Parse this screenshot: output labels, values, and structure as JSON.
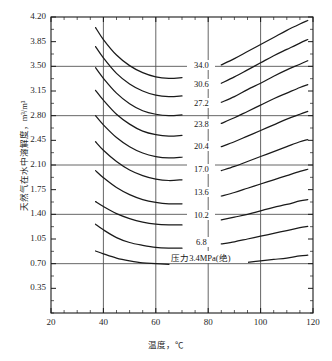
{
  "chart_data": {
    "type": "line",
    "title": "",
    "xlabel": "温度，℃",
    "ylabel": "天然气在水中溶解度，m³/m³",
    "xlim": [
      20,
      120
    ],
    "ylim": [
      0,
      4.2
    ],
    "xticks": [
      20,
      40,
      60,
      80,
      100,
      120
    ],
    "yticks": [
      0.35,
      0.7,
      1.05,
      1.4,
      1.75,
      2.1,
      2.45,
      2.8,
      3.15,
      3.5,
      3.85,
      4.2
    ],
    "xminor_step": 5,
    "grid": {
      "x": [
        40,
        60,
        80,
        100
      ],
      "y": [
        0.7,
        1.4,
        2.1,
        2.8,
        3.5
      ]
    },
    "legend_position": "inline-curve-labels",
    "annotation": "压力3.4MPa(绝)",
    "series_unit": "MPa",
    "series": [
      {
        "name": "34.0",
        "label": "34.0",
        "x": [
          37,
          40,
          45,
          50,
          55,
          60,
          65,
          70,
          75,
          80,
          85,
          90,
          95,
          100,
          105,
          110,
          115,
          118
        ],
        "values": [
          4.05,
          3.88,
          3.66,
          3.51,
          3.41,
          3.35,
          3.33,
          3.34,
          3.38,
          3.44,
          3.52,
          3.61,
          3.71,
          3.81,
          3.91,
          4.01,
          4.1,
          4.15
        ]
      },
      {
        "name": "30.6",
        "label": "30.6",
        "x": [
          37,
          40,
          45,
          50,
          55,
          60,
          65,
          70,
          75,
          80,
          85,
          90,
          95,
          100,
          105,
          110,
          115,
          118
        ],
        "values": [
          3.78,
          3.62,
          3.4,
          3.25,
          3.15,
          3.09,
          3.07,
          3.08,
          3.12,
          3.18,
          3.26,
          3.35,
          3.45,
          3.55,
          3.65,
          3.74,
          3.83,
          3.88
        ]
      },
      {
        "name": "27.2",
        "label": "27.2",
        "x": [
          37,
          40,
          45,
          50,
          55,
          60,
          65,
          70,
          75,
          80,
          85,
          90,
          95,
          100,
          105,
          110,
          115,
          118
        ],
        "values": [
          3.48,
          3.33,
          3.12,
          2.97,
          2.87,
          2.82,
          2.8,
          2.81,
          2.85,
          2.91,
          2.99,
          3.07,
          3.17,
          3.26,
          3.36,
          3.45,
          3.53,
          3.58
        ]
      },
      {
        "name": "23.8",
        "label": "23.8",
        "x": [
          37,
          40,
          45,
          50,
          55,
          60,
          65,
          70,
          75,
          80,
          85,
          90,
          95,
          100,
          105,
          110,
          115,
          118
        ],
        "values": [
          3.16,
          3.02,
          2.82,
          2.68,
          2.58,
          2.53,
          2.51,
          2.52,
          2.56,
          2.62,
          2.69,
          2.77,
          2.86,
          2.95,
          3.04,
          3.12,
          3.2,
          3.24
        ]
      },
      {
        "name": "20.4",
        "label": "20.4",
        "x": [
          37,
          40,
          45,
          50,
          55,
          60,
          65,
          70,
          75,
          80,
          85,
          90,
          95,
          100,
          105,
          110,
          115,
          118
        ],
        "values": [
          2.8,
          2.67,
          2.49,
          2.36,
          2.27,
          2.22,
          2.2,
          2.21,
          2.24,
          2.29,
          2.36,
          2.43,
          2.51,
          2.59,
          2.67,
          2.75,
          2.82,
          2.86
        ]
      },
      {
        "name": "17.0",
        "label": "17.0",
        "x": [
          37,
          40,
          45,
          50,
          55,
          60,
          65,
          70,
          75,
          80,
          85,
          90,
          95,
          100,
          105,
          110,
          115,
          118
        ],
        "values": [
          2.43,
          2.31,
          2.15,
          2.03,
          1.95,
          1.9,
          1.88,
          1.89,
          1.92,
          1.96,
          2.02,
          2.08,
          2.15,
          2.22,
          2.29,
          2.36,
          2.43,
          2.46
        ]
      },
      {
        "name": "13.6",
        "label": "13.6",
        "x": [
          37,
          40,
          45,
          50,
          55,
          60,
          65,
          70,
          75,
          80,
          85,
          90,
          95,
          100,
          105,
          110,
          115,
          118
        ],
        "values": [
          2.02,
          1.92,
          1.78,
          1.68,
          1.61,
          1.57,
          1.55,
          1.55,
          1.57,
          1.61,
          1.66,
          1.71,
          1.77,
          1.83,
          1.89,
          1.95,
          2.01,
          2.04
        ]
      },
      {
        "name": "10.2",
        "label": "10.2",
        "x": [
          37,
          40,
          45,
          50,
          55,
          60,
          65,
          70,
          75,
          80,
          85,
          90,
          95,
          100,
          105,
          110,
          115,
          118
        ],
        "values": [
          1.58,
          1.51,
          1.41,
          1.34,
          1.29,
          1.26,
          1.25,
          1.25,
          1.26,
          1.29,
          1.32,
          1.36,
          1.4,
          1.45,
          1.5,
          1.54,
          1.59,
          1.61
        ]
      },
      {
        "name": "6.8",
        "label": "6.8",
        "x": [
          37,
          40,
          45,
          50,
          55,
          60,
          65,
          70,
          75,
          80,
          85,
          90,
          95,
          100,
          105,
          110,
          115,
          118
        ],
        "values": [
          1.26,
          1.18,
          1.07,
          1.0,
          0.96,
          0.93,
          0.92,
          0.92,
          0.93,
          0.95,
          0.98,
          1.01,
          1.05,
          1.09,
          1.13,
          1.17,
          1.21,
          1.23
        ]
      },
      {
        "name": "3.4",
        "label": "压力3.4MPa(绝)",
        "x": [
          37,
          40,
          45,
          50,
          55,
          60,
          65,
          70,
          75,
          80,
          85,
          90,
          95,
          100,
          105,
          110,
          115,
          118
        ],
        "values": [
          0.88,
          0.84,
          0.78,
          0.74,
          0.71,
          0.7,
          0.69,
          0.69,
          0.69,
          0.7,
          0.7,
          0.71,
          0.72,
          0.74,
          0.76,
          0.78,
          0.81,
          0.82
        ]
      }
    ],
    "curve_label_positions": [
      {
        "series": "34.0",
        "x": 77,
        "y": 3.5
      },
      {
        "series": "30.6",
        "x": 77,
        "y": 3.24
      },
      {
        "series": "27.2",
        "x": 77,
        "y": 2.96
      },
      {
        "series": "23.8",
        "x": 77,
        "y": 2.67
      },
      {
        "series": "20.4",
        "x": 77,
        "y": 2.36
      },
      {
        "series": "17.0",
        "x": 77,
        "y": 2.03
      },
      {
        "series": "13.6",
        "x": 77,
        "y": 1.7
      },
      {
        "series": "10.2",
        "x": 77,
        "y": 1.37
      },
      {
        "series": "6.8",
        "x": 77,
        "y": 1.0
      },
      {
        "series": "3.4",
        "x": 80,
        "y": 0.8
      }
    ],
    "style": {
      "line_color": "#1a1a1a",
      "grid_color": "#555555",
      "frame_color": "#1a1a1a"
    }
  },
  "axis": {
    "xtick_labels": [
      "20",
      "40",
      "60",
      "80",
      "100",
      "120"
    ],
    "ytick_labels": [
      "0.35",
      "0.70",
      "1.05",
      "1.40",
      "1.75",
      "2.10",
      "2.45",
      "2.80",
      "3.15",
      "3.50",
      "3.85",
      "4.20"
    ],
    "xlabel": "温度，℃",
    "ylabel": "天然气在水中溶解度，m³/m³"
  }
}
